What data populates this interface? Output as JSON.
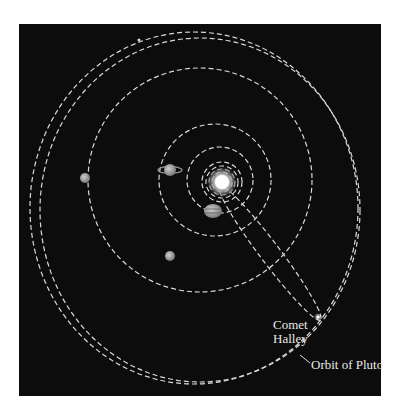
{
  "diagram": {
    "type": "solar-system-orbits",
    "background_color": "#0c0c0c",
    "orbit_color": "#d9d9d9",
    "labels": {
      "comet": "Comet\nHalley",
      "pluto_orbit": "Orbit of Pluto"
    },
    "bodies": [
      {
        "name": "sun",
        "x": 222,
        "y": 182
      },
      {
        "name": "jupiter",
        "x": 213,
        "y": 211
      },
      {
        "name": "saturn",
        "x": 170,
        "y": 170
      },
      {
        "name": "uranus",
        "x": 85,
        "y": 178
      },
      {
        "name": "neptune",
        "x": 170,
        "y": 256
      },
      {
        "name": "comet-halley",
        "x": 318,
        "y": 317
      }
    ]
  }
}
